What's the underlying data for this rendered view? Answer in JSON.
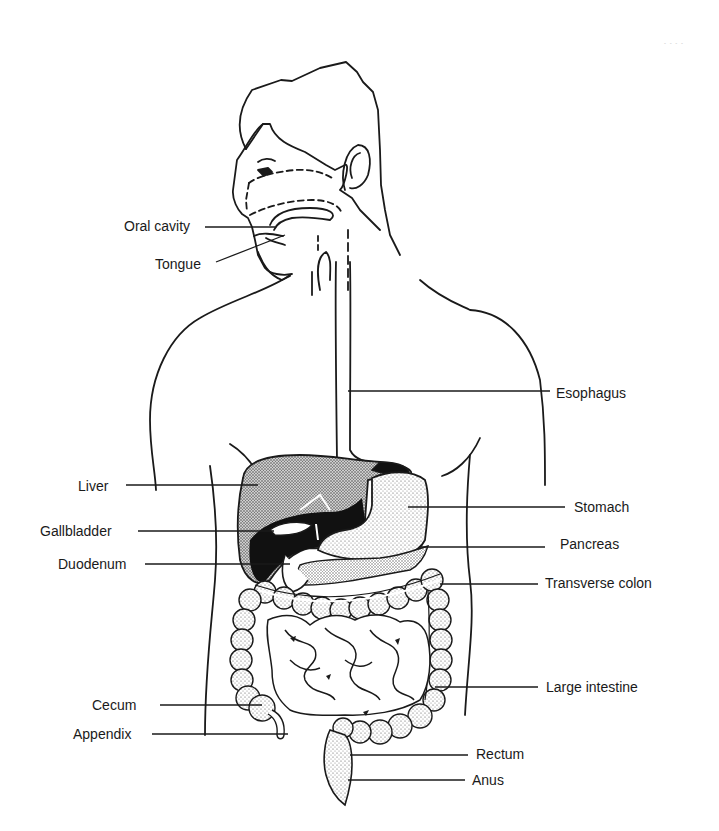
{
  "figure": {
    "corner_mark": "- - - -",
    "colors": {
      "ink": "#1a1a1a",
      "background": "#ffffff",
      "stipple": "#555555",
      "liver_dark": "#111111"
    }
  },
  "labels": [
    {
      "id": "oral-cavity",
      "text": "Oral cavity",
      "x": 124,
      "y": 218,
      "side": "left",
      "leader": [
        [
          205,
          227
        ],
        [
          275,
          227
        ]
      ]
    },
    {
      "id": "tongue",
      "text": "Tongue",
      "x": 155,
      "y": 256,
      "side": "left",
      "leader": [
        [
          216,
          262
        ],
        [
          285,
          235
        ]
      ]
    },
    {
      "id": "esophagus",
      "text": "Esophagus",
      "x": 556,
      "y": 385,
      "side": "right",
      "leader": [
        [
          348,
          391
        ],
        [
          550,
          391
        ]
      ]
    },
    {
      "id": "liver",
      "text": "Liver",
      "x": 78,
      "y": 478,
      "side": "left",
      "leader": [
        [
          126,
          485
        ],
        [
          258,
          485
        ]
      ]
    },
    {
      "id": "stomach",
      "text": "Stomach",
      "x": 574,
      "y": 499,
      "side": "right",
      "leader": [
        [
          408,
          507
        ],
        [
          565,
          507
        ]
      ]
    },
    {
      "id": "gallbladder",
      "text": "Gallbladder",
      "x": 40,
      "y": 523,
      "side": "left",
      "leader": [
        [
          138,
          531
        ],
        [
          274,
          531
        ]
      ]
    },
    {
      "id": "pancreas",
      "text": "Pancreas",
      "x": 560,
      "y": 536,
      "side": "right",
      "leader": [
        [
          420,
          547
        ],
        [
          545,
          547
        ]
      ]
    },
    {
      "id": "duodenum",
      "text": "Duodenum",
      "x": 58,
      "y": 556,
      "side": "left",
      "leader": [
        [
          145,
          564
        ],
        [
          290,
          564
        ]
      ]
    },
    {
      "id": "transverse-colon",
      "text": "Transverse colon",
      "x": 545,
      "y": 575,
      "side": "right",
      "leader": [
        [
          440,
          584
        ],
        [
          538,
          584
        ]
      ]
    },
    {
      "id": "large-intestine",
      "text": "Large intestine",
      "x": 546,
      "y": 679,
      "side": "right",
      "leader": [
        [
          435,
          687
        ],
        [
          538,
          687
        ]
      ]
    },
    {
      "id": "cecum",
      "text": "Cecum",
      "x": 92,
      "y": 697,
      "side": "left",
      "leader": [
        [
          160,
          705
        ],
        [
          262,
          705
        ]
      ]
    },
    {
      "id": "appendix",
      "text": "Appendix",
      "x": 73,
      "y": 726,
      "side": "left",
      "leader": [
        [
          152,
          734
        ],
        [
          288,
          734
        ]
      ]
    },
    {
      "id": "rectum",
      "text": "Rectum",
      "x": 476,
      "y": 746,
      "side": "right",
      "leader": [
        [
          350,
          755
        ],
        [
          468,
          755
        ]
      ]
    },
    {
      "id": "anus",
      "text": "Anus",
      "x": 472,
      "y": 772,
      "side": "right",
      "leader": [
        [
          348,
          780
        ],
        [
          465,
          780
        ]
      ]
    }
  ]
}
